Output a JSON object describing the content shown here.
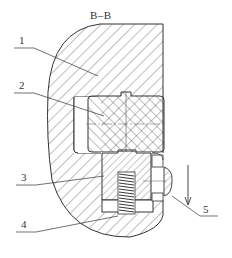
{
  "figure": {
    "section_title": "B–B",
    "line_color": "#333333",
    "background": "#ffffff"
  },
  "parts": [
    {
      "number": "1",
      "description": "body / housing"
    },
    {
      "number": "2",
      "description": "sliding block"
    },
    {
      "number": "3",
      "description": "plunger"
    },
    {
      "number": "4",
      "description": "spring"
    },
    {
      "number": "5",
      "description": "pin / stop"
    }
  ],
  "annotations": {
    "direction_arrow": "downward-arrow"
  }
}
